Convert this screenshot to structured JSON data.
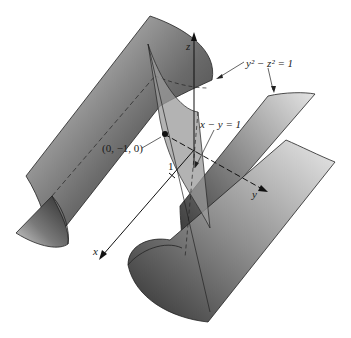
{
  "figure": {
    "surface_label": "y² − z² = 1",
    "plane_label": "x − y = 1",
    "point_label": "(0, −1, 0)",
    "tick_label": "1",
    "axes": {
      "x": "x",
      "y": "y",
      "z": "z"
    }
  },
  "colors": {
    "surface_dark": "#3a3a3a",
    "surface_light": "#d8d8d8",
    "plane": "#9a9a9a",
    "ink": "#1a1a1a"
  }
}
